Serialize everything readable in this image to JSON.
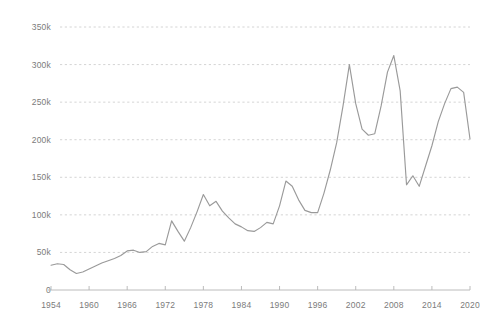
{
  "chart_data": {
    "type": "line",
    "title": "",
    "subtitle": "",
    "xlabel": "",
    "ylabel": "",
    "xlim": [
      1954,
      2020
    ],
    "ylim": [
      0,
      360000
    ],
    "grid": true,
    "legend": "none",
    "y_ticks": [
      0,
      50000,
      100000,
      150000,
      200000,
      250000,
      300000,
      350000
    ],
    "y_tick_labels": [
      "0",
      "50k",
      "100k",
      "150k",
      "200k",
      "250k",
      "300k",
      "350k"
    ],
    "x_ticks": [
      1954,
      1960,
      1966,
      1972,
      1978,
      1984,
      1990,
      1996,
      2002,
      2008,
      2014,
      2020
    ],
    "x_tick_labels": [
      "1954",
      "1960",
      "1966",
      "1972",
      "1978",
      "1984",
      "1990",
      "1996",
      "2002",
      "2008",
      "2014",
      "2020"
    ],
    "line_color": "#9a9a9a",
    "grid_color": "#c9c9c9",
    "axis_color": "#b4b4b4",
    "label_color": "#7b7b7b",
    "series": [
      {
        "name": "value",
        "x": [
          1954,
          1955,
          1956,
          1957,
          1958,
          1959,
          1960,
          1961,
          1962,
          1963,
          1964,
          1965,
          1966,
          1967,
          1968,
          1969,
          1970,
          1971,
          1972,
          1973,
          1974,
          1975,
          1976,
          1977,
          1978,
          1979,
          1980,
          1981,
          1982,
          1983,
          1984,
          1985,
          1986,
          1987,
          1988,
          1989,
          1990,
          1991,
          1992,
          1993,
          1994,
          1995,
          1996,
          1997,
          1998,
          1999,
          2000,
          2001,
          2002,
          2003,
          2004,
          2005,
          2006,
          2007,
          2008,
          2009,
          2010,
          2011,
          2012,
          2013,
          2014,
          2015,
          2016,
          2017,
          2018,
          2019,
          2020
        ],
        "values": [
          33000,
          35000,
          34000,
          27000,
          22000,
          24000,
          28000,
          32000,
          36000,
          39000,
          42000,
          46000,
          52000,
          53000,
          50000,
          51000,
          58000,
          62000,
          60000,
          92000,
          78000,
          65000,
          83000,
          104000,
          127000,
          112000,
          118000,
          105000,
          96000,
          88000,
          84000,
          79000,
          78000,
          83000,
          90000,
          88000,
          112000,
          145000,
          138000,
          120000,
          106000,
          103000,
          103000,
          129000,
          160000,
          196000,
          245000,
          300000,
          248000,
          214000,
          206000,
          208000,
          245000,
          290000,
          312000,
          265000,
          140000,
          152000,
          138000,
          165000,
          192000,
          224000,
          248000,
          268000,
          270000,
          263000,
          201000
        ]
      }
    ]
  }
}
